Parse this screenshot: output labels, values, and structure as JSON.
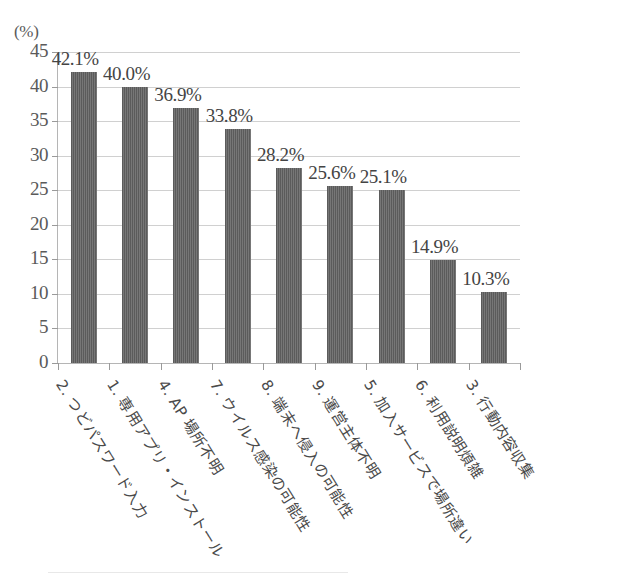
{
  "chart_data": {
    "type": "bar",
    "title": "",
    "subtitle": "",
    "xlabel": "",
    "ylabel": "(%)",
    "unit_label": "(%)",
    "ylim": [
      0,
      45
    ],
    "ytick_step": 5,
    "grid": true,
    "legend": false,
    "orientation": "vertical",
    "bar_color": "#5b5b5b",
    "categories": [
      "2. つどパスワード入力",
      "1. 専用アプリ・インストール",
      "4. AP 場所不明",
      "7. ウイルス感染の可能性",
      "8. 端末へ侵入の可能性",
      "9. 運営主体不明",
      "5. 加入サービスで場所違い",
      "6. 利用説明煩雑",
      "3. 行動内容収集"
    ],
    "values": [
      42.1,
      40.0,
      36.9,
      33.8,
      28.2,
      25.6,
      25.1,
      14.9,
      10.3
    ],
    "data_labels": [
      "42.1%",
      "40.0%",
      "36.9%",
      "33.8%",
      "28.2%",
      "25.6%",
      "25.1%",
      "14.9%",
      "10.3%"
    ],
    "ytick_labels": [
      "45",
      "40",
      "35",
      "30",
      "25",
      "20",
      "15",
      "10",
      "5",
      "0"
    ],
    "ytick_values": [
      45,
      40,
      35,
      30,
      25,
      20,
      15,
      10,
      5,
      0
    ]
  }
}
